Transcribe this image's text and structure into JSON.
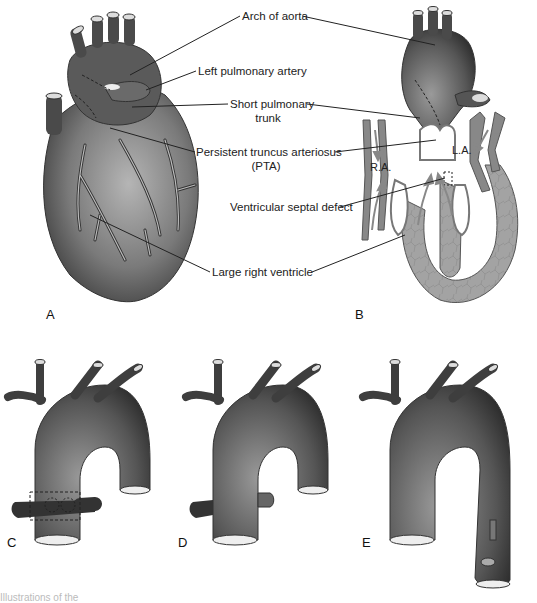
{
  "figure": {
    "labels": {
      "arch_of_aorta": "Arch of aorta",
      "left_pulmonary_artery": "Left pulmonary artery",
      "short_pulmonary_trunk_1": "Short pulmonary",
      "short_pulmonary_trunk_2": "trunk",
      "pta_1": "Persistent truncus arteriosus",
      "pta_2": "(PTA)",
      "vsd": "Ventricular septal defect",
      "large_rv": "Large right ventricle",
      "ra": "R.A.",
      "la": "L.A."
    },
    "panels": {
      "a": "A",
      "b": "B",
      "c": "C",
      "d": "D",
      "e": "E"
    },
    "caption": "Illustrations of the"
  },
  "colors": {
    "vessel_dark": "#3a3a3a",
    "vessel_mid": "#777777",
    "myocardium": "#9a9a9a",
    "line": "#222222"
  }
}
